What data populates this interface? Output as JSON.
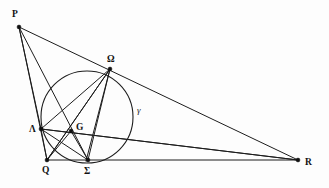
{
  "figure": {
    "width": 329,
    "height": 188,
    "background_color": "#fdfdfd",
    "stroke_color": "#1d1d1d",
    "label_color": "#111111"
  },
  "points": [
    {
      "id": "P",
      "label": "P",
      "x": 19,
      "y": 27,
      "label_x": 12,
      "label_y": 17,
      "dot": true
    },
    {
      "id": "Omega",
      "label": "Ω",
      "x": 110,
      "y": 69,
      "label_x": 107,
      "label_y": 62,
      "dot": true
    },
    {
      "id": "Lambda",
      "label": "Λ",
      "x": 41,
      "y": 129,
      "label_x": 29,
      "label_y": 132,
      "dot": true
    },
    {
      "id": "G",
      "label": "G",
      "x": 71,
      "y": 131,
      "label_x": 76,
      "label_y": 130,
      "dot": true
    },
    {
      "id": "Q",
      "label": "Q",
      "x": 47,
      "y": 160,
      "label_x": 42,
      "label_y": 173,
      "dot": true
    },
    {
      "id": "Sigma",
      "label": "Σ",
      "x": 88,
      "y": 160,
      "label_x": 84,
      "label_y": 174,
      "dot": true
    },
    {
      "id": "R",
      "label": "R",
      "x": 298,
      "y": 160,
      "label_x": 305,
      "label_y": 165,
      "dot": true
    }
  ],
  "circle": {
    "id": "gamma",
    "label": "γ",
    "center_x": 87,
    "center_y": 117,
    "radius": 46,
    "label_x": 137,
    "label_y": 113
  },
  "segments": [
    {
      "id": "P-Q",
      "from": "P",
      "to": "Q",
      "x1": 19,
      "y1": 27,
      "x2": 47,
      "y2": 160
    },
    {
      "id": "P-Sigma",
      "from": "P",
      "to": "Sigma",
      "x1": 19,
      "y1": 27,
      "x2": 88,
      "y2": 160
    },
    {
      "id": "P-R",
      "from": "P",
      "to": "R",
      "x1": 19,
      "y1": 27,
      "x2": 298,
      "y2": 160
    },
    {
      "id": "P-Lambda",
      "from": "P",
      "to": "Lambda",
      "x1": 19,
      "y1": 27,
      "x2": 41,
      "y2": 129
    },
    {
      "id": "Q-R",
      "from": "Q",
      "to": "R",
      "x1": 47,
      "y1": 160,
      "x2": 298,
      "y2": 160
    },
    {
      "id": "Lambda-R",
      "from": "Lambda",
      "to": "R",
      "x1": 41,
      "y1": 129,
      "x2": 298,
      "y2": 160
    },
    {
      "id": "Omega-Q",
      "from": "Omega",
      "to": "Q",
      "x1": 110,
      "y1": 69,
      "x2": 47,
      "y2": 160
    },
    {
      "id": "Omega-Sigma",
      "from": "Omega",
      "to": "Sigma",
      "x1": 110,
      "y1": 69,
      "x2": 88,
      "y2": 160
    },
    {
      "id": "Omega-Lambda",
      "from": "Omega",
      "to": "Lambda",
      "x1": 110,
      "y1": 69,
      "x2": 41,
      "y2": 129
    },
    {
      "id": "Omega-G-Sigma",
      "from": "Omega",
      "to": "Sigma",
      "x1": 110,
      "y1": 69,
      "x2": 86,
      "y2": 161
    },
    {
      "id": "Lambda-Sigma",
      "from": "Lambda",
      "to": "Sigma",
      "x1": 41,
      "y1": 129,
      "x2": 88,
      "y2": 160
    },
    {
      "id": "Lambda-Q",
      "from": "Lambda",
      "to": "Q",
      "x1": 41,
      "y1": 129,
      "x2": 47,
      "y2": 160
    },
    {
      "id": "Q-G-Omega",
      "from": "Q",
      "to": "Omega",
      "x1": 47,
      "y1": 160,
      "x2": 110,
      "y2": 69
    },
    {
      "id": "Lambda-G-R",
      "from": "Lambda",
      "to": "R",
      "x1": 41,
      "y1": 129,
      "x2": 298,
      "y2": 160
    },
    {
      "id": "G-Sigma",
      "from": "G",
      "to": "Sigma",
      "x1": 71,
      "y1": 131,
      "x2": 88,
      "y2": 160
    },
    {
      "id": "G-Q",
      "from": "G",
      "to": "Q",
      "x1": 71,
      "y1": 131,
      "x2": 47,
      "y2": 160
    }
  ]
}
